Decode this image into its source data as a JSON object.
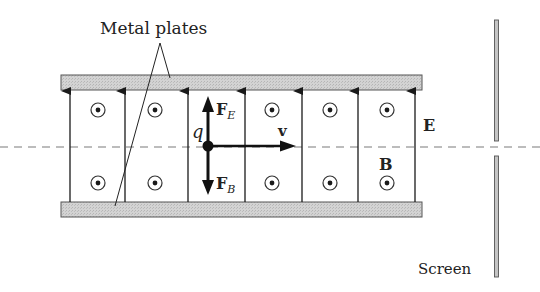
{
  "labels": {
    "metal_plates": "Metal plates",
    "screen": "Screen",
    "charge": "q",
    "velocity": "v",
    "electric_field": "E",
    "magnetic_field": "B",
    "force_electric_main": "F",
    "force_electric_sub": "E",
    "force_magnetic_main": "F",
    "force_magnetic_sub": "B"
  },
  "colors": {
    "ink": "#1a1a1a",
    "plate_fill": "#cfcfcf",
    "plate_stroke": "#555555",
    "dashed_axis": "#777777",
    "screen_fill": "#bdbdbd"
  },
  "geometry": {
    "field_lines_x": [
      70,
      125,
      188,
      245,
      302,
      358,
      415
    ],
    "b_field_dots_x": [
      98,
      155,
      272,
      330,
      387
    ],
    "b_field_dots_y": [
      110,
      183
    ]
  }
}
